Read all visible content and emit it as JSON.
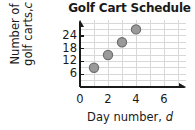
{
  "chart_data": {
    "type": "scatter",
    "title": "Golf Cart Schedule",
    "xlabel": "Day number, d",
    "xlabel_main": "Day number,",
    "xlabel_var": "d",
    "ylabel": "Number of golf carts, c",
    "ylabel_line1": "Number of",
    "ylabel_line2_main": "golf carts,",
    "ylabel_line2_var": "c",
    "x": [
      1,
      2,
      3,
      4
    ],
    "values": [
      9,
      15,
      21,
      27
    ],
    "points": [
      {
        "d": 1,
        "c": 9
      },
      {
        "d": 2,
        "c": 15
      },
      {
        "d": 3,
        "c": 21
      },
      {
        "d": 4,
        "c": 27
      }
    ],
    "xlim": [
      0,
      7
    ],
    "ylim": [
      0,
      30
    ],
    "xticks": [
      0,
      2,
      4,
      6
    ],
    "xtick_labels": [
      "0",
      "2",
      "4",
      "6"
    ],
    "yticks": [
      6,
      12,
      18,
      24
    ],
    "ytick_labels": [
      "6",
      "12",
      "18",
      "24"
    ],
    "x_minor_step": 1,
    "y_minor_step": 3,
    "grid": true,
    "legend": null,
    "colors": {
      "marker_fill": "#9a9a9a",
      "marker_edge": "#6e6e6e",
      "grid": "#d8d8d8",
      "axis": "#1a1a1a",
      "text": "#1a1a1a",
      "background": "#ffffff"
    }
  }
}
